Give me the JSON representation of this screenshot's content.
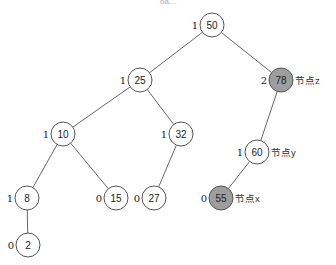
{
  "diagram": {
    "type": "binary-tree",
    "title_fragment": "ба…",
    "colors": {
      "node_fill": "#ffffff",
      "highlight_fill": "#9e9e9e",
      "stroke": "#555555"
    },
    "nodes": [
      {
        "id": "n50",
        "key": "50",
        "balance": "1",
        "x": 212,
        "y": 25,
        "highlight": false,
        "tag": ""
      },
      {
        "id": "n25",
        "key": "25",
        "balance": "1",
        "x": 140,
        "y": 80,
        "highlight": false,
        "tag": ""
      },
      {
        "id": "n78",
        "key": "78",
        "balance": "2",
        "x": 281,
        "y": 80,
        "highlight": true,
        "tag": "节点z"
      },
      {
        "id": "n10",
        "key": "10",
        "balance": "1",
        "x": 63,
        "y": 134,
        "highlight": false,
        "tag": ""
      },
      {
        "id": "n32",
        "key": "32",
        "balance": "1",
        "x": 181,
        "y": 134,
        "highlight": false,
        "tag": ""
      },
      {
        "id": "n60",
        "key": "60",
        "balance": "1",
        "x": 257,
        "y": 152,
        "highlight": false,
        "tag": "节点y"
      },
      {
        "id": "n8",
        "key": "8",
        "balance": "1",
        "x": 27,
        "y": 198,
        "highlight": false,
        "tag": ""
      },
      {
        "id": "n15",
        "key": "15",
        "balance": "0",
        "x": 116,
        "y": 198,
        "highlight": false,
        "tag": ""
      },
      {
        "id": "n27",
        "key": "27",
        "balance": "0",
        "x": 154,
        "y": 198,
        "highlight": false,
        "tag": ""
      },
      {
        "id": "n55",
        "key": "55",
        "balance": "0",
        "x": 221,
        "y": 198,
        "highlight": true,
        "tag": "节点x"
      },
      {
        "id": "n2",
        "key": "2",
        "balance": "0",
        "x": 28,
        "y": 245,
        "highlight": false,
        "tag": ""
      }
    ],
    "edges": [
      [
        "n50",
        "n25"
      ],
      [
        "n50",
        "n78"
      ],
      [
        "n25",
        "n10"
      ],
      [
        "n25",
        "n32"
      ],
      [
        "n78",
        "n60"
      ],
      [
        "n10",
        "n8"
      ],
      [
        "n10",
        "n15"
      ],
      [
        "n32",
        "n27"
      ],
      [
        "n60",
        "n55"
      ],
      [
        "n8",
        "n2"
      ]
    ],
    "labels": {
      "node_z": "节点z",
      "node_y": "节点y",
      "node_x": "节点x"
    }
  }
}
